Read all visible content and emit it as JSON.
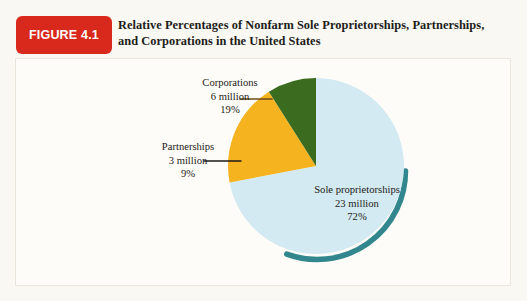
{
  "figure": {
    "badge_label": "FIGURE 4.1",
    "title_line_1": "Relative Percentages of Nonfarm Sole Proprietorships, Partnerships,",
    "title_line_2": "and Corporations in the United States"
  },
  "colors": {
    "badge_red": "#d8291c",
    "sole_blue": "#d3eaf2",
    "partnerships_green": "#3a6b1e",
    "corporations_yellow": "#f5b31f",
    "shadow_teal": "#1f7d83",
    "page_background": "#f7f5ef",
    "panel_background": "#fdfcf8",
    "panel_border": "#eae6db",
    "text": "#1d1a17",
    "leader_line": "#6b4a14"
  },
  "labels": {
    "corporations": {
      "name": "Corporations",
      "amount": "6 million",
      "percent": "19%"
    },
    "partnerships": {
      "name": "Partnerships",
      "amount": "3 million",
      "percent": "9%"
    },
    "sole_proprietorships": {
      "name": "Sole proprietorships",
      "amount": "23 million",
      "percent": "72%"
    }
  },
  "chart_data": {
    "type": "pie",
    "title": "Relative Percentages of Nonfarm Sole Proprietorships, Partnerships, and Corporations in the United States",
    "subtitle": "",
    "xlabel": "",
    "ylabel": "",
    "legend_position": "callout-labels",
    "grid": false,
    "unit": "millions of firms",
    "start_angle_deg": 0,
    "direction": "clockwise",
    "categories": [
      "Sole proprietorships",
      "Corporations",
      "Partnerships"
    ],
    "values": [
      72,
      19,
      9
    ],
    "counts_millions": [
      23,
      6,
      3
    ],
    "slices": [
      {
        "label": "Sole proprietorships",
        "percent": 72,
        "count_millions": 23,
        "count_text": "23 million",
        "percent_text": "72%",
        "color": "#d3eaf2",
        "start_deg": 0,
        "sweep_deg": 259.2
      },
      {
        "label": "Corporations",
        "percent": 19,
        "count_millions": 6,
        "count_text": "6 million",
        "percent_text": "19%",
        "color": "#f5b31f",
        "start_deg": 259.2,
        "sweep_deg": 68.4
      },
      {
        "label": "Partnerships",
        "percent": 9,
        "count_millions": 3,
        "count_text": "3 million",
        "percent_text": "9%",
        "color": "#3a6b1e",
        "start_deg": 327.6,
        "sweep_deg": 32.4
      }
    ]
  }
}
